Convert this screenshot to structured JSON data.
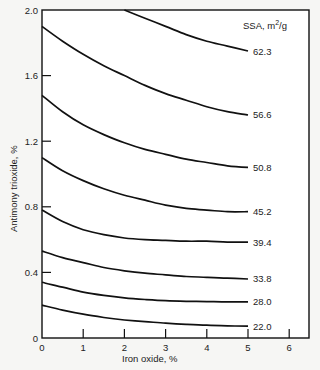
{
  "chart_data": {
    "type": "line",
    "title": "",
    "xlabel": "Iron oxide, %",
    "ylabel": "Antimony trioxide, %",
    "xlim": [
      0,
      6.5
    ],
    "ylim": [
      0,
      2.0
    ],
    "xticks": [
      0,
      1,
      2,
      3,
      4,
      5,
      6
    ],
    "xtick_labels": [
      "0",
      "1",
      "2",
      "3",
      "4",
      "5",
      "6"
    ],
    "yticks": [
      0,
      0.4,
      0.8,
      1.2,
      1.6,
      2.0
    ],
    "ytick_labels": [
      "0",
      "0.4",
      "0.8",
      "1.2",
      "1.6",
      "2.0"
    ],
    "grid": false,
    "legend_title": "SSA, m²/g",
    "legend_title_parts": {
      "prefix": "SSA, m",
      "sup": "2",
      "suffix": "/g"
    },
    "series": [
      {
        "name": "62.3",
        "x": [
          2.0,
          2.5,
          3.0,
          3.5,
          4.0,
          4.5,
          5.0
        ],
        "y": [
          2.0,
          1.95,
          1.9,
          1.85,
          1.81,
          1.78,
          1.75
        ]
      },
      {
        "name": "56.6",
        "x": [
          0,
          0.5,
          1,
          1.5,
          2,
          2.5,
          3,
          3.5,
          4,
          4.5,
          5
        ],
        "y": [
          1.9,
          1.81,
          1.73,
          1.66,
          1.6,
          1.54,
          1.49,
          1.45,
          1.41,
          1.38,
          1.36
        ]
      },
      {
        "name": "50.8",
        "x": [
          0,
          0.5,
          1,
          1.5,
          2,
          2.5,
          3,
          3.5,
          4,
          4.5,
          5
        ],
        "y": [
          1.48,
          1.38,
          1.3,
          1.24,
          1.19,
          1.15,
          1.12,
          1.09,
          1.07,
          1.05,
          1.04
        ]
      },
      {
        "name": "45.2",
        "x": [
          0,
          0.5,
          1,
          1.5,
          2,
          2.5,
          3,
          3.5,
          4,
          4.5,
          5
        ],
        "y": [
          1.1,
          1.02,
          0.96,
          0.91,
          0.87,
          0.84,
          0.81,
          0.79,
          0.78,
          0.77,
          0.77
        ]
      },
      {
        "name": "39.4",
        "x": [
          0,
          0.5,
          1,
          1.5,
          2,
          2.5,
          3,
          3.5,
          4,
          4.5,
          5
        ],
        "y": [
          0.78,
          0.71,
          0.66,
          0.63,
          0.61,
          0.6,
          0.595,
          0.59,
          0.59,
          0.585,
          0.585
        ]
      },
      {
        "name": "33.8",
        "x": [
          0,
          0.5,
          1,
          1.5,
          2,
          2.5,
          3,
          3.5,
          4,
          4.5,
          5
        ],
        "y": [
          0.53,
          0.49,
          0.46,
          0.43,
          0.41,
          0.395,
          0.385,
          0.375,
          0.37,
          0.365,
          0.36
        ]
      },
      {
        "name": "28.0",
        "x": [
          0,
          0.5,
          1,
          1.5,
          2,
          2.5,
          3,
          3.5,
          4,
          4.5,
          5
        ],
        "y": [
          0.34,
          0.31,
          0.28,
          0.26,
          0.245,
          0.235,
          0.228,
          0.224,
          0.222,
          0.22,
          0.22
        ]
      },
      {
        "name": "22.0",
        "x": [
          0,
          0.5,
          1,
          1.5,
          2,
          2.5,
          3,
          3.5,
          4,
          4.5,
          5
        ],
        "y": [
          0.2,
          0.17,
          0.145,
          0.125,
          0.11,
          0.1,
          0.09,
          0.083,
          0.078,
          0.074,
          0.072
        ]
      }
    ]
  }
}
